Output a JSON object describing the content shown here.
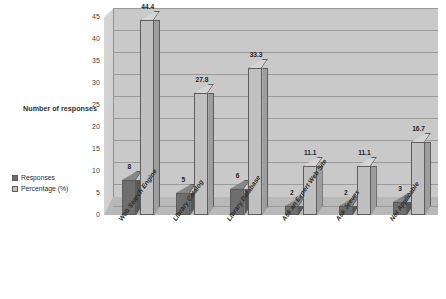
{
  "chart_data": {
    "type": "bar",
    "title": "",
    "xlabel": "",
    "ylabel": "Number of responses",
    "ylim": [
      0,
      45
    ],
    "ytick_step": 5,
    "yticks": [
      "0",
      "5",
      "10",
      "15",
      "20",
      "25",
      "30",
      "35",
      "40",
      "45"
    ],
    "grid": true,
    "legend_position": "left",
    "categories": [
      "Web Search Engine",
      "Library Catalog",
      "Library Database",
      "Ask an Expert Web Site",
      "Ask Jeeves",
      "Not Applicable"
    ],
    "series": [
      {
        "name": "Responses",
        "color": "#6e6e6e",
        "values": [
          8,
          5,
          6,
          2,
          2,
          3
        ],
        "labels": [
          "8",
          "5",
          "6",
          "2",
          "2",
          "3"
        ]
      },
      {
        "name": "Percentage (%)",
        "color": "#c0c0c0",
        "values": [
          44.4,
          27.8,
          33.3,
          11.1,
          11.1,
          16.7
        ],
        "labels": [
          "44.4",
          "27.8",
          "33.3",
          "11.1",
          "11.1",
          "16.7"
        ]
      }
    ]
  },
  "legend": {
    "entries": [
      {
        "label": "Responses"
      },
      {
        "label": "Percentage (%)"
      }
    ]
  },
  "axis": {
    "y_title": "Number of responses"
  },
  "colors": {
    "responses": "#6e6e6e",
    "percentage": "#c0c0c0",
    "plot_background": "#c9c9c9",
    "floor": "#b8b8b8",
    "gridline": "#9b9b9b"
  }
}
